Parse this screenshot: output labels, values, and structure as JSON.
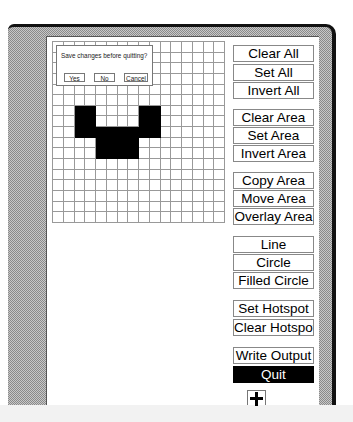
{
  "dialog": {
    "message": "Save changes before quitting?",
    "buttons": [
      "Yes",
      "No",
      "Cancel"
    ]
  },
  "bitmap": {
    "columns": 16,
    "rows": 17,
    "set_cells": [
      [
        6,
        2
      ],
      [
        6,
        3
      ],
      [
        6,
        8
      ],
      [
        6,
        9
      ],
      [
        7,
        2
      ],
      [
        7,
        3
      ],
      [
        7,
        8
      ],
      [
        7,
        9
      ],
      [
        8,
        2
      ],
      [
        8,
        3
      ],
      [
        8,
        4
      ],
      [
        8,
        5
      ],
      [
        8,
        6
      ],
      [
        8,
        7
      ],
      [
        8,
        8
      ],
      [
        8,
        9
      ],
      [
        9,
        4
      ],
      [
        9,
        5
      ],
      [
        9,
        6
      ],
      [
        9,
        7
      ],
      [
        10,
        4
      ],
      [
        10,
        5
      ],
      [
        10,
        6
      ],
      [
        10,
        7
      ]
    ]
  },
  "commands": [
    {
      "label": "Clear All",
      "top": 45
    },
    {
      "label": "Set All",
      "top": 64
    },
    {
      "label": "Invert All",
      "top": 82
    },
    {
      "label": "Clear Area",
      "top": 109
    },
    {
      "label": "Set Area",
      "top": 127
    },
    {
      "label": "Invert Area",
      "top": 145
    },
    {
      "label": "Copy Area",
      "top": 172
    },
    {
      "label": "Move Area",
      "top": 190
    },
    {
      "label": "Overlay Area",
      "top": 208
    },
    {
      "label": "Line",
      "top": 236
    },
    {
      "label": "Circle",
      "top": 254
    },
    {
      "label": "Filled Circle",
      "top": 272
    },
    {
      "label": "Set Hotspot",
      "top": 300
    },
    {
      "label": "Clear Hotspot",
      "top": 319
    },
    {
      "label": "Write Output",
      "top": 347
    },
    {
      "label": "Quit",
      "top": 366,
      "highlighted": true
    }
  ],
  "hotspot_indicator": "crosshair-icon"
}
